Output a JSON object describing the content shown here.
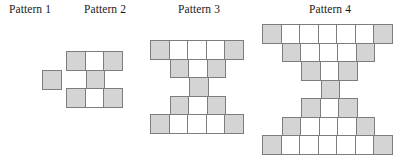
{
  "figure": {
    "title_font": "serif",
    "cell_size_px": 19.5,
    "colors": {
      "shaded_fill": "#d4d4d4",
      "blank_fill": "#ffffff",
      "cell_border": "#7d7d7d",
      "label_text": "#1a1a1a",
      "background": "#ffffff"
    },
    "patterns": [
      {
        "label": "Pattern 1",
        "label_center_x": 30,
        "label_y": 3,
        "figure_x": 42,
        "figure_y": 70,
        "row_widths": [
          1
        ],
        "rows": [
          {
            "offset": 0,
            "cells": [
              "shaded"
            ]
          }
        ]
      },
      {
        "label": "Pattern 2",
        "label_center_x": 105,
        "label_y": 3,
        "figure_x": 66,
        "figure_y": 51,
        "row_widths": [
          3,
          1,
          3
        ],
        "rows": [
          {
            "offset": 0,
            "cells": [
              "shaded",
              "blank",
              "shaded"
            ]
          },
          {
            "offset": 1,
            "cells": [
              "shaded"
            ]
          },
          {
            "offset": 0,
            "cells": [
              "shaded",
              "blank",
              "shaded"
            ]
          }
        ]
      },
      {
        "label": "Pattern 3",
        "label_center_x": 199,
        "label_y": 3,
        "figure_x": 150,
        "figure_y": 40,
        "row_widths": [
          5,
          3,
          1,
          3,
          5
        ],
        "rows": [
          {
            "offset": 0,
            "cells": [
              "shaded",
              "blank",
              "blank",
              "blank",
              "shaded"
            ]
          },
          {
            "offset": 1,
            "cells": [
              "shaded",
              "blank",
              "shaded"
            ]
          },
          {
            "offset": 2,
            "cells": [
              "shaded"
            ]
          },
          {
            "offset": 1,
            "cells": [
              "shaded",
              "blank",
              "shaded"
            ]
          },
          {
            "offset": 0,
            "cells": [
              "shaded",
              "blank",
              "blank",
              "blank",
              "shaded"
            ]
          }
        ]
      },
      {
        "label": "Pattern 4",
        "label_center_x": 330,
        "label_y": 3,
        "figure_x": 262,
        "figure_y": 24,
        "row_widths": [
          7,
          5,
          3,
          1,
          3,
          5,
          7
        ],
        "rows": [
          {
            "offset": 0,
            "cells": [
              "shaded",
              "blank",
              "blank",
              "blank",
              "blank",
              "blank",
              "shaded"
            ]
          },
          {
            "offset": 1,
            "cells": [
              "shaded",
              "blank",
              "blank",
              "blank",
              "shaded"
            ]
          },
          {
            "offset": 2,
            "cells": [
              "shaded",
              "blank",
              "shaded"
            ]
          },
          {
            "offset": 3,
            "cells": [
              "shaded"
            ]
          },
          {
            "offset": 2,
            "cells": [
              "shaded",
              "blank",
              "shaded"
            ]
          },
          {
            "offset": 1,
            "cells": [
              "shaded",
              "blank",
              "blank",
              "blank",
              "shaded"
            ]
          },
          {
            "offset": 0,
            "cells": [
              "shaded",
              "blank",
              "blank",
              "blank",
              "blank",
              "blank",
              "shaded"
            ]
          }
        ]
      }
    ]
  }
}
